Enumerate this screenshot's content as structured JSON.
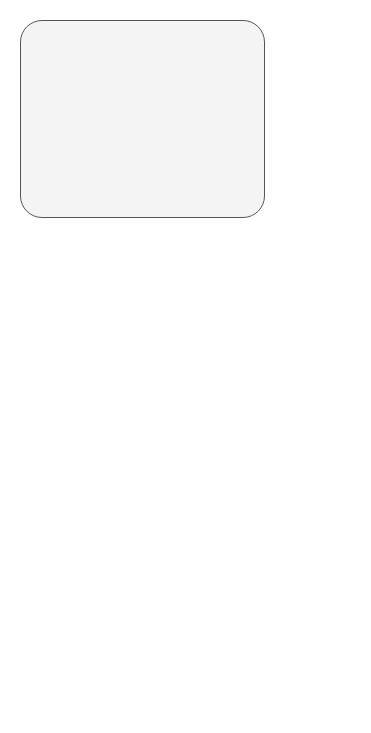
{
  "inception_block": {
    "label": "Inception Block",
    "nodes": [
      {
        "id": "ib-maxpool",
        "text": "Max pooling\n3 x 3",
        "fill": "dark"
      },
      {
        "id": "ib-conv1a",
        "text": "Convolution\n1 x 1",
        "fill": "light"
      },
      {
        "id": "ib-conv1b",
        "text": "Convolution\n1 x 1",
        "fill": "light"
      },
      {
        "id": "ib-conv1c",
        "text": "Convolution\n1 x 1",
        "fill": "light"
      },
      {
        "id": "ib-conv1d",
        "text": "Convolution\n1 x 1",
        "fill": "light"
      },
      {
        "id": "ib-conv5",
        "text": "Convolution\n5 x 5",
        "fill": "mid"
      },
      {
        "id": "ib-conv3",
        "text": "Convolution\n3 x 3",
        "fill": "mid"
      },
      {
        "id": "ib-concat",
        "text": "Concat",
        "fill": "light"
      }
    ]
  },
  "main_column": [
    {
      "text": "Input",
      "fill": "white"
    },
    {
      "text": "Convolution\n7 x 7",
      "fill": "dark"
    },
    {
      "text": "Max pooling\n3 x 3",
      "fill": "dark"
    },
    {
      "text": "LocalResp\nNorm",
      "fill": "dark"
    },
    {
      "text": "Convolution\n1 x 1",
      "fill": "light"
    },
    {
      "text": "Convolution\n3 x 3",
      "fill": "mid"
    },
    {
      "text": "LocalResp\nNorm",
      "fill": "dark"
    },
    {
      "text": "Max pooling\n3 x 3",
      "fill": "dark"
    },
    {
      "text": "Inception\nBlock",
      "fill": "light"
    },
    {
      "text": "Inception\nBlock",
      "fill": "light"
    },
    {
      "text": "Inception\nBlock",
      "fill": "light"
    },
    {
      "text": "Inception\nBlock",
      "fill": "light"
    },
    {
      "text": "Inception\nBlock",
      "fill": "light"
    },
    {
      "text": "Inception\nBlock",
      "fill": "light"
    },
    {
      "text": "Inception\nBlock",
      "fill": "light"
    },
    {
      "text": "Inception\nBlock",
      "fill": "light"
    },
    {
      "text": "Inception\nBlock",
      "fill": "light"
    },
    {
      "text": "Average pooling\n7 x 7",
      "fill": "mid"
    },
    {
      "text": "Fully Connected",
      "fill": "mid"
    },
    {
      "text": "Output 3",
      "fill": "white"
    }
  ],
  "branch_1": [
    {
      "text": "Average pooling\n5 x 5",
      "fill": "mid"
    },
    {
      "text": "Convolution\n1 x 1",
      "fill": "mid"
    },
    {
      "text": "Fully Connected",
      "fill": "mid"
    },
    {
      "text": "Fully Connected",
      "fill": "mid"
    },
    {
      "text": "Output 1",
      "fill": "white"
    }
  ],
  "branch_2": [
    {
      "text": "Average pooling\n5 x 5",
      "fill": "mid"
    },
    {
      "text": "Convolution\n1 x 1",
      "fill": "mid"
    },
    {
      "text": "Fully Connected",
      "fill": "mid"
    },
    {
      "text": "Fully Connected",
      "fill": "mid"
    },
    {
      "text": "Output 1",
      "fill": "white"
    }
  ],
  "branch_sources": {
    "branch_1": 9,
    "branch_2": 13
  }
}
